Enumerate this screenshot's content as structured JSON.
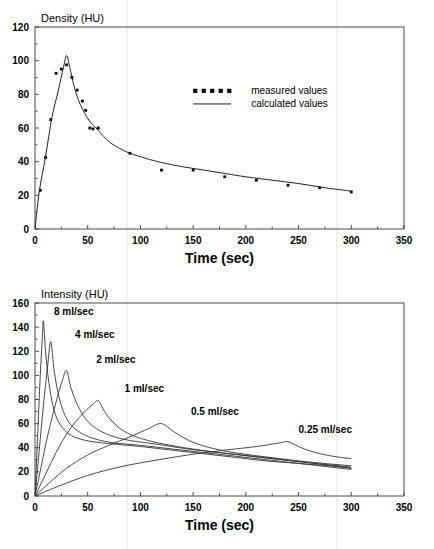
{
  "chart_data": [
    {
      "id": "top",
      "type": "line",
      "title": "",
      "ylabel": "Density (HU)",
      "xlabel": "Time (sec)",
      "xlim": [
        0,
        350
      ],
      "ylim": [
        0,
        120
      ],
      "xticks": [
        0,
        50,
        100,
        150,
        200,
        250,
        300,
        350
      ],
      "yticks": [
        0,
        20,
        40,
        60,
        80,
        100,
        120
      ],
      "xminor_step": 25,
      "yminor_step": 10,
      "grid": false,
      "legend_position": "center-right",
      "legend": [
        {
          "label": "measured values",
          "marker": "dotted-squares"
        },
        {
          "label": "calculated values",
          "marker": "solid-line"
        }
      ],
      "series": [
        {
          "name": "measured values",
          "style": "points",
          "points": [
            {
              "x": 5,
              "y": 23
            },
            {
              "x": 10,
              "y": 42.5
            },
            {
              "x": 15,
              "y": 65
            },
            {
              "x": 20,
              "y": 92.5
            },
            {
              "x": 25,
              "y": 95
            },
            {
              "x": 30,
              "y": 97.5
            },
            {
              "x": 35,
              "y": 90
            },
            {
              "x": 40,
              "y": 82.5
            },
            {
              "x": 45,
              "y": 76
            },
            {
              "x": 48,
              "y": 70.5
            },
            {
              "x": 52,
              "y": 60
            },
            {
              "x": 55,
              "y": 59.5
            },
            {
              "x": 60,
              "y": 60
            },
            {
              "x": 90,
              "y": 45
            },
            {
              "x": 120,
              "y": 35
            },
            {
              "x": 150,
              "y": 35
            },
            {
              "x": 180,
              "y": 31
            },
            {
              "x": 210,
              "y": 29
            },
            {
              "x": 240,
              "y": 26
            },
            {
              "x": 270,
              "y": 24.5
            },
            {
              "x": 300,
              "y": 22
            }
          ]
        },
        {
          "name": "calculated values",
          "style": "line",
          "points": [
            {
              "x": 0,
              "y": 0
            },
            {
              "x": 4,
              "y": 22
            },
            {
              "x": 10,
              "y": 43
            },
            {
              "x": 16,
              "y": 66
            },
            {
              "x": 22,
              "y": 82
            },
            {
              "x": 27,
              "y": 96
            },
            {
              "x": 30,
              "y": 103
            },
            {
              "x": 33,
              "y": 96
            },
            {
              "x": 37,
              "y": 85
            },
            {
              "x": 41,
              "y": 77
            },
            {
              "x": 46,
              "y": 70
            },
            {
              "x": 52,
              "y": 64
            },
            {
              "x": 58,
              "y": 60
            },
            {
              "x": 65,
              "y": 55
            },
            {
              "x": 72,
              "y": 51
            },
            {
              "x": 80,
              "y": 48
            },
            {
              "x": 90,
              "y": 45
            },
            {
              "x": 105,
              "y": 42
            },
            {
              "x": 120,
              "y": 39.5
            },
            {
              "x": 140,
              "y": 37
            },
            {
              "x": 160,
              "y": 35
            },
            {
              "x": 180,
              "y": 33
            },
            {
              "x": 200,
              "y": 31
            },
            {
              "x": 225,
              "y": 29
            },
            {
              "x": 250,
              "y": 27
            },
            {
              "x": 275,
              "y": 24.5
            },
            {
              "x": 300,
              "y": 22.5
            }
          ]
        }
      ]
    },
    {
      "id": "bottom",
      "type": "line",
      "title": "",
      "ylabel": "Intensity (HU)",
      "xlabel": "Time (sec)",
      "xlim": [
        0,
        350
      ],
      "ylim": [
        0,
        160
      ],
      "xticks": [
        0,
        50,
        100,
        150,
        200,
        250,
        300,
        350
      ],
      "yticks": [
        0,
        20,
        40,
        60,
        80,
        100,
        120,
        140,
        160
      ],
      "xminor_step": 25,
      "yminor_step": 10,
      "grid": false,
      "legend_position": "inline-annotations",
      "annotations": [
        {
          "text": "8 ml/sec",
          "x": 18,
          "y": 150
        },
        {
          "text": "4 ml/sec",
          "x": 38,
          "y": 131
        },
        {
          "text": "2 ml/sec",
          "x": 58,
          "y": 110
        },
        {
          "text": "1 ml/sec",
          "x": 85,
          "y": 86
        },
        {
          "text": "0.5 ml/sec",
          "x": 148,
          "y": 67
        },
        {
          "text": "0.25 ml/sec",
          "x": 250,
          "y": 52
        }
      ],
      "series": [
        {
          "name": "8 ml/sec",
          "style": "line",
          "points": [
            {
              "x": 0,
              "y": 0
            },
            {
              "x": 3,
              "y": 60
            },
            {
              "x": 5,
              "y": 100
            },
            {
              "x": 7,
              "y": 132
            },
            {
              "x": 8,
              "y": 145
            },
            {
              "x": 10,
              "y": 120
            },
            {
              "x": 13,
              "y": 95
            },
            {
              "x": 17,
              "y": 75
            },
            {
              "x": 22,
              "y": 62
            },
            {
              "x": 30,
              "y": 53
            },
            {
              "x": 40,
              "y": 48
            },
            {
              "x": 55,
              "y": 45
            },
            {
              "x": 75,
              "y": 43
            },
            {
              "x": 100,
              "y": 41
            },
            {
              "x": 130,
              "y": 38
            },
            {
              "x": 160,
              "y": 35
            },
            {
              "x": 190,
              "y": 32
            },
            {
              "x": 220,
              "y": 29
            },
            {
              "x": 250,
              "y": 27
            },
            {
              "x": 280,
              "y": 24
            },
            {
              "x": 300,
              "y": 22
            }
          ]
        },
        {
          "name": "4 ml/sec",
          "style": "line",
          "points": [
            {
              "x": 0,
              "y": 0
            },
            {
              "x": 4,
              "y": 38
            },
            {
              "x": 8,
              "y": 75
            },
            {
              "x": 12,
              "y": 108
            },
            {
              "x": 15,
              "y": 128
            },
            {
              "x": 18,
              "y": 105
            },
            {
              "x": 22,
              "y": 85
            },
            {
              "x": 27,
              "y": 70
            },
            {
              "x": 34,
              "y": 59
            },
            {
              "x": 44,
              "y": 52
            },
            {
              "x": 58,
              "y": 47
            },
            {
              "x": 75,
              "y": 44
            },
            {
              "x": 100,
              "y": 42
            },
            {
              "x": 130,
              "y": 39
            },
            {
              "x": 160,
              "y": 36
            },
            {
              "x": 190,
              "y": 33
            },
            {
              "x": 220,
              "y": 30
            },
            {
              "x": 250,
              "y": 27
            },
            {
              "x": 280,
              "y": 25
            },
            {
              "x": 300,
              "y": 23
            }
          ]
        },
        {
          "name": "2 ml/sec",
          "style": "line",
          "points": [
            {
              "x": 0,
              "y": 0
            },
            {
              "x": 6,
              "y": 25
            },
            {
              "x": 12,
              "y": 50
            },
            {
              "x": 20,
              "y": 78
            },
            {
              "x": 26,
              "y": 96
            },
            {
              "x": 30,
              "y": 104
            },
            {
              "x": 34,
              "y": 90
            },
            {
              "x": 40,
              "y": 76
            },
            {
              "x": 48,
              "y": 64
            },
            {
              "x": 58,
              "y": 56
            },
            {
              "x": 72,
              "y": 50
            },
            {
              "x": 90,
              "y": 46
            },
            {
              "x": 115,
              "y": 43
            },
            {
              "x": 145,
              "y": 39
            },
            {
              "x": 175,
              "y": 36
            },
            {
              "x": 205,
              "y": 33
            },
            {
              "x": 235,
              "y": 30
            },
            {
              "x": 265,
              "y": 27
            },
            {
              "x": 300,
              "y": 23
            }
          ]
        },
        {
          "name": "1 ml/sec",
          "style": "line",
          "points": [
            {
              "x": 0,
              "y": 0
            },
            {
              "x": 10,
              "y": 18
            },
            {
              "x": 20,
              "y": 36
            },
            {
              "x": 32,
              "y": 54
            },
            {
              "x": 45,
              "y": 68
            },
            {
              "x": 55,
              "y": 76
            },
            {
              "x": 60,
              "y": 79
            },
            {
              "x": 66,
              "y": 70
            },
            {
              "x": 74,
              "y": 61
            },
            {
              "x": 84,
              "y": 54
            },
            {
              "x": 96,
              "y": 49
            },
            {
              "x": 112,
              "y": 45
            },
            {
              "x": 135,
              "y": 41
            },
            {
              "x": 165,
              "y": 37
            },
            {
              "x": 195,
              "y": 34
            },
            {
              "x": 225,
              "y": 31
            },
            {
              "x": 255,
              "y": 28
            },
            {
              "x": 300,
              "y": 24
            }
          ]
        },
        {
          "name": "0.5 ml/sec",
          "style": "line",
          "points": [
            {
              "x": 0,
              "y": 0
            },
            {
              "x": 15,
              "y": 12
            },
            {
              "x": 30,
              "y": 23
            },
            {
              "x": 50,
              "y": 34
            },
            {
              "x": 70,
              "y": 42
            },
            {
              "x": 90,
              "y": 49
            },
            {
              "x": 108,
              "y": 56
            },
            {
              "x": 120,
              "y": 60
            },
            {
              "x": 132,
              "y": 53
            },
            {
              "x": 146,
              "y": 46
            },
            {
              "x": 162,
              "y": 41
            },
            {
              "x": 182,
              "y": 37
            },
            {
              "x": 205,
              "y": 34
            },
            {
              "x": 232,
              "y": 31
            },
            {
              "x": 262,
              "y": 28
            },
            {
              "x": 300,
              "y": 25
            }
          ]
        },
        {
          "name": "0.25 ml/sec",
          "style": "line",
          "points": [
            {
              "x": 0,
              "y": 0
            },
            {
              "x": 25,
              "y": 9
            },
            {
              "x": 50,
              "y": 17
            },
            {
              "x": 80,
              "y": 24
            },
            {
              "x": 110,
              "y": 29
            },
            {
              "x": 145,
              "y": 34
            },
            {
              "x": 180,
              "y": 38
            },
            {
              "x": 210,
              "y": 41
            },
            {
              "x": 232,
              "y": 44
            },
            {
              "x": 240,
              "y": 45
            },
            {
              "x": 250,
              "y": 41
            },
            {
              "x": 262,
              "y": 37
            },
            {
              "x": 276,
              "y": 34
            },
            {
              "x": 290,
              "y": 32
            },
            {
              "x": 300,
              "y": 31
            }
          ]
        }
      ]
    }
  ]
}
